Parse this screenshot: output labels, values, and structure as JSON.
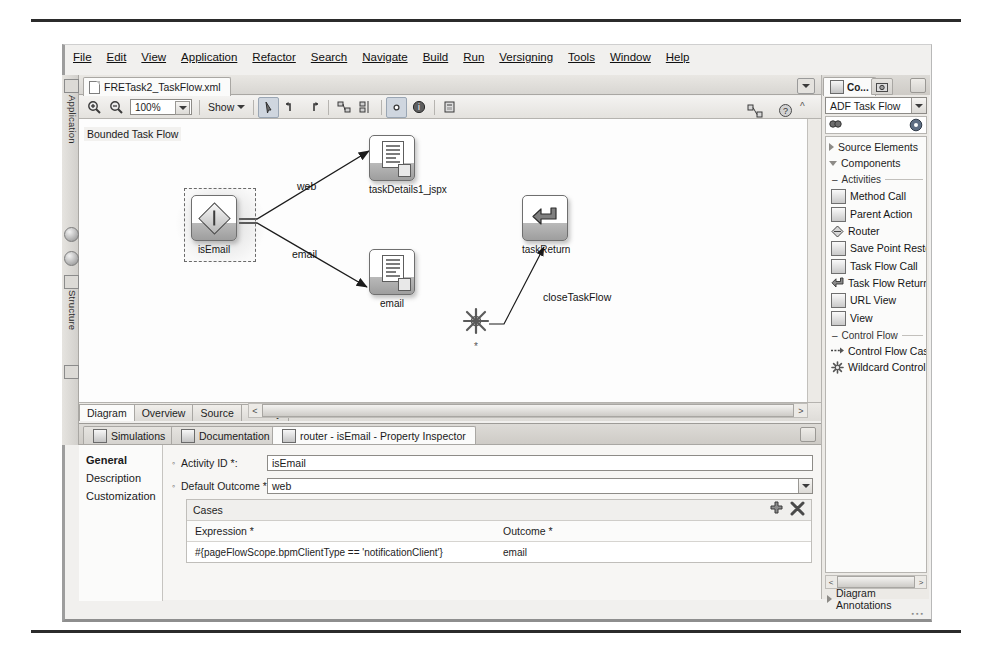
{
  "menu": {
    "items": [
      "File",
      "Edit",
      "View",
      "Application",
      "Refactor",
      "Search",
      "Navigate",
      "Build",
      "Run",
      "Versigning",
      "Tools",
      "Window",
      "Help"
    ]
  },
  "editor": {
    "file_tab": "FRETask2_TaskFlow.xml",
    "toolbar": {
      "zoom_level": "100%",
      "show_label": "Show",
      "icons": [
        "zoom-in-icon",
        "zoom-out-icon",
        "zoom-combo",
        "show-menu",
        "pointer-tool-icon",
        "elbow-up-left-icon",
        "elbow-up-right-icon",
        "align-group-icon",
        "align-distribute-icon",
        "toggle-grid-icon",
        "info-icon",
        "publish-icon",
        "thumbnail-icon",
        "help-icon"
      ]
    },
    "canvas": {
      "bounded_label": "Bounded Task Flow",
      "nodes": [
        {
          "id": "isEmail",
          "caption": "isEmail",
          "kind": "router",
          "selected": true
        },
        {
          "id": "taskDetails1_jspx",
          "caption": "taskDetails1_jspx",
          "kind": "view",
          "selected": false
        },
        {
          "id": "email",
          "caption": "email",
          "kind": "view",
          "selected": false
        },
        {
          "id": "taskReturn",
          "caption": "taskReturn",
          "kind": "task-flow-return",
          "selected": false
        },
        {
          "id": "wildcard",
          "caption": "*",
          "kind": "wildcard-control-flow-rule",
          "selected": false
        }
      ],
      "edges": [
        {
          "label": "web",
          "from": "isEmail",
          "to": "taskDetails1_jspx"
        },
        {
          "label": "email",
          "from": "isEmail",
          "to": "email"
        },
        {
          "label": "closeTaskFlow",
          "from": "wildcard",
          "to": "taskReturn"
        }
      ]
    },
    "bottom_tabs": [
      {
        "label": "Diagram",
        "active": true
      },
      {
        "label": "Overview",
        "active": false
      },
      {
        "label": "Source",
        "active": false
      },
      {
        "label": "History",
        "active": false
      }
    ]
  },
  "left_dock": {
    "items": [
      {
        "label": "Application",
        "icon": "application-icon"
      },
      {
        "label": "Structure",
        "icon": "structure-icon"
      }
    ]
  },
  "inspector": {
    "tabs": [
      {
        "label": "Simulations",
        "icon": "simulations-icon",
        "active": false
      },
      {
        "label": "Documentation",
        "icon": "documentation-icon",
        "active": false
      },
      {
        "label": "router - isEmail - Property Inspector",
        "icon": "router-icon",
        "active": true
      }
    ],
    "nav": [
      {
        "label": "General",
        "active": true
      },
      {
        "label": "Description",
        "active": false
      },
      {
        "label": "Customization",
        "active": false
      }
    ],
    "fields": [
      {
        "label": "Activity ID *:",
        "value": "isEmail",
        "type": "text"
      },
      {
        "label": "Default Outcome *:",
        "value": "web",
        "type": "combo"
      }
    ],
    "cases": {
      "title": "Cases",
      "add_label": "+",
      "remove_label": "✕",
      "columns": [
        "Expression *",
        "Outcome *"
      ],
      "rows": [
        {
          "expression": "#{pageFlowScope.bpmClientType == 'notificationClient'}",
          "outcome": "email"
        }
      ]
    }
  },
  "palette": {
    "tab_label": "Co...",
    "selected_library": "ADF Task Flow",
    "search_placeholder": "",
    "groups": [
      {
        "label": "Source Elements",
        "expanded": false
      },
      {
        "label": "Components",
        "expanded": true
      }
    ],
    "sections": [
      {
        "label": "Activities",
        "items": [
          {
            "label": "Method Call",
            "icon": "method-call-icon"
          },
          {
            "label": "Parent Action",
            "icon": "parent-action-icon"
          },
          {
            "label": "Router",
            "icon": "router-icon"
          },
          {
            "label": "Save Point Restore",
            "icon": "save-point-restore-icon"
          },
          {
            "label": "Task Flow Call",
            "icon": "task-flow-call-icon"
          },
          {
            "label": "Task Flow Return",
            "icon": "task-flow-return-icon"
          },
          {
            "label": "URL View",
            "icon": "url-view-icon"
          },
          {
            "label": "View",
            "icon": "view-icon"
          }
        ]
      },
      {
        "label": "Control Flow",
        "items": [
          {
            "label": "Control Flow Case",
            "icon": "control-flow-case-icon"
          },
          {
            "label": "Wildcard Control Flow Ru",
            "icon": "wildcard-control-flow-icon"
          }
        ]
      }
    ],
    "footer": {
      "label": "Diagram Annotations"
    }
  },
  "colors": {
    "window_bg": "#f1f0ee",
    "canvas_bg": "#fdfdfd",
    "chrome": "#e6e4e0",
    "selection": "#cfd6df",
    "rule": "#2b2b2b"
  }
}
